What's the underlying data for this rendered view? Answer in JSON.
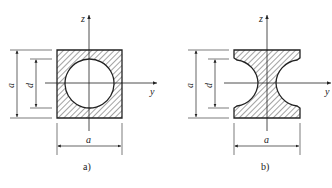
{
  "figures": [
    {
      "id": "a",
      "caption": "a)",
      "shape": "square section with circular hole",
      "labels": {
        "z_axis": "z",
        "y_axis": "y",
        "outer_height": "a",
        "inner_diameter": "d",
        "outer_width": "a"
      }
    },
    {
      "id": "b",
      "caption": "b)",
      "shape": "square section with two semicircular side notches",
      "labels": {
        "z_axis": "z",
        "y_axis": "y",
        "outer_height": "a",
        "notch_diameter": "d",
        "outer_width": "a"
      }
    }
  ],
  "colors": {
    "line": "#222222",
    "hatch": "#333333",
    "background": "#ffffff"
  }
}
